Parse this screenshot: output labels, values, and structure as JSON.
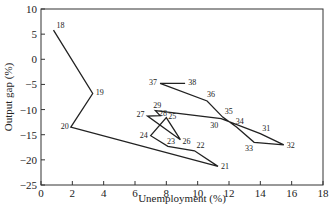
{
  "chart_data": {
    "type": "line",
    "title": "",
    "xlabel": "Unemployment (%)",
    "ylabel": "Output gap (%)",
    "xlim": [
      0,
      18
    ],
    "ylim": [
      -25,
      10
    ],
    "xticks": [
      0,
      2,
      4,
      6,
      8,
      10,
      12,
      14,
      16,
      18
    ],
    "yticks": [
      10,
      5,
      0,
      -5,
      -10,
      -15,
      -20,
      -25
    ],
    "grid": false,
    "legend": null,
    "series": [
      {
        "name": "Output gap vs unemployment (labelled by year)",
        "points": [
          {
            "label": "18",
            "x": 0.8,
            "y": 5.8
          },
          {
            "label": "19",
            "x": 3.3,
            "y": -6.8
          },
          {
            "label": "20",
            "x": 1.9,
            "y": -13.5
          },
          {
            "label": "21",
            "x": 11.3,
            "y": -21.3
          },
          {
            "label": "22",
            "x": 9.8,
            "y": -18.2
          },
          {
            "label": "23",
            "x": 8.1,
            "y": -17.3
          },
          {
            "label": "24",
            "x": 7.0,
            "y": -15.2
          },
          {
            "label": "25",
            "x": 8.0,
            "y": -11.6
          },
          {
            "label": "26",
            "x": 8.9,
            "y": -16.0
          },
          {
            "label": "27",
            "x": 6.8,
            "y": -11.3
          },
          {
            "label": "28",
            "x": 7.6,
            "y": -11.2
          },
          {
            "label": "29",
            "x": 7.3,
            "y": -10.2
          },
          {
            "label": "30",
            "x": 11.5,
            "y": -11.8
          },
          {
            "label": "31",
            "x": 14.0,
            "y": -14.8
          },
          {
            "label": "32",
            "x": 15.5,
            "y": -17.0
          },
          {
            "label": "33",
            "x": 13.6,
            "y": -16.5
          },
          {
            "label": "34",
            "x": 12.5,
            "y": -13.5
          },
          {
            "label": "35",
            "x": 11.6,
            "y": -11.5
          },
          {
            "label": "36",
            "x": 10.6,
            "y": -8.3
          },
          {
            "label": "37",
            "x": 7.6,
            "y": -4.8
          },
          {
            "label": "38",
            "x": 9.2,
            "y": -4.8
          }
        ]
      }
    ]
  },
  "axes": {
    "x_label": "Unemployment (%)",
    "y_label": "Output gap (%)"
  }
}
